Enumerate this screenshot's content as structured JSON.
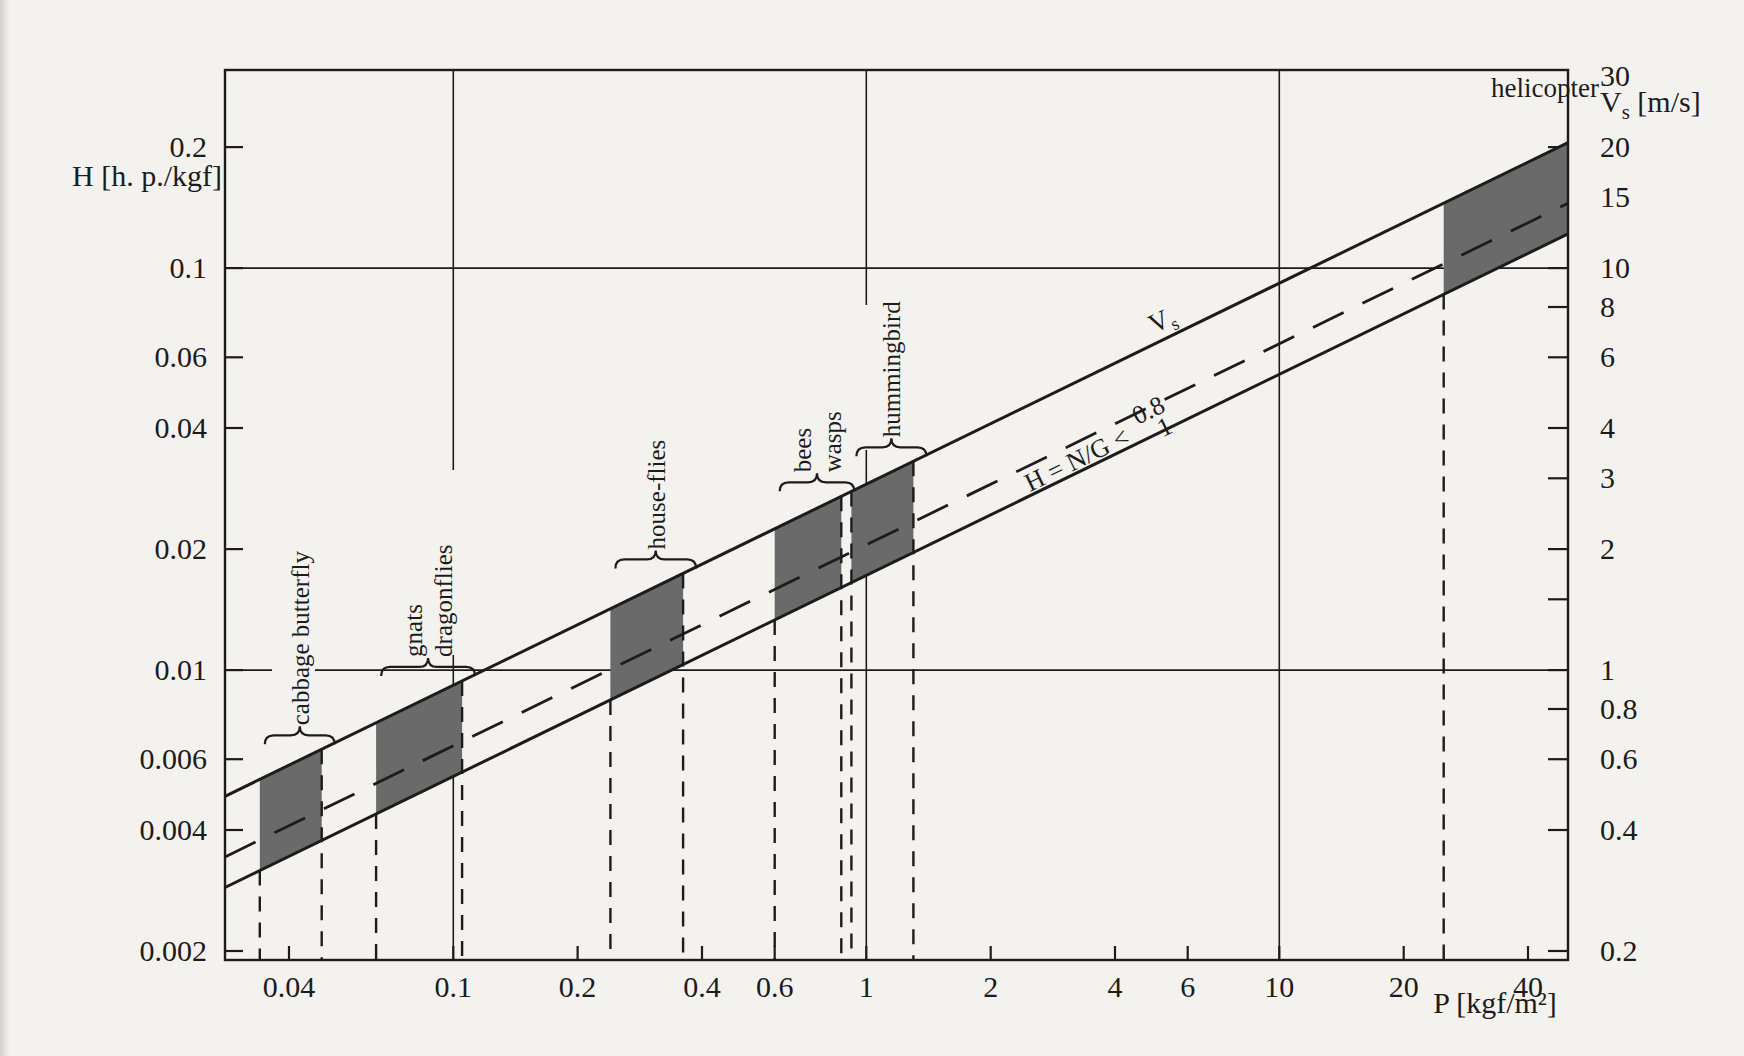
{
  "page": {
    "background": "#f4f2ee",
    "ink": "#1c1c1c"
  },
  "chart_data": {
    "type": "area",
    "x_axis": {
      "label": "P [kgf/m²]",
      "scale": "log",
      "min": 0.028,
      "max": 50,
      "ticks": [
        "0.04",
        "0.1",
        "0.2",
        "0.4",
        "0.6",
        "1",
        "2",
        "4",
        "6",
        "10",
        "20",
        "40"
      ],
      "gridlines": [
        "0.1",
        "1",
        "10"
      ]
    },
    "y_axis": {
      "label": "H [h. p./kgf]",
      "scale": "log",
      "min": 0.0019,
      "max": 0.311,
      "ticks": [
        "0.2",
        "0.1",
        "0.06",
        "0.04",
        "0.02",
        "0.01",
        "0.006",
        "0.004",
        "0.002"
      ],
      "gridlines": [
        "0.1",
        "0.01"
      ]
    },
    "y2_axis": {
      "label": "Vs [m/s]",
      "label_main": "V",
      "label_sub": "s",
      "label_unit": " [m/s]",
      "scale": "log",
      "relation": "Vs = 100 × H",
      "ticks": [
        "30",
        "20",
        "15",
        "10",
        "8",
        "6",
        "4",
        "3",
        "2",
        "1.5",
        "1",
        "0.8",
        "0.6",
        "0.4",
        "0.2"
      ],
      "unlabeled": [
        "1.5"
      ]
    },
    "band_lines": [
      {
        "id": "upper",
        "label": "0.8",
        "H_at_P1": 0.029,
        "log_slope": 0.5,
        "style": "solid"
      },
      {
        "id": "vs",
        "label": "Vs",
        "H_at_P1": 0.0205,
        "log_slope": 0.5,
        "style": "dashed"
      },
      {
        "id": "lower",
        "label": "1",
        "H_at_P1": 0.0172,
        "log_slope": 0.5,
        "style": "solid"
      }
    ],
    "annotation": {
      "text": "H = N/G <",
      "upper": "0.8",
      "lower": "1"
    },
    "vs_line_label": {
      "main": "V",
      "sub": "s"
    },
    "segments": [
      {
        "id": "cabbage-butterfly",
        "label_lines": [
          "cabbage butterfly"
        ],
        "p_min": 0.034,
        "p_max": 0.048,
        "brace": true,
        "vertical_label": true,
        "clipped_right": false
      },
      {
        "id": "gnats-dragonflies",
        "label_lines": [
          "gnats",
          "dragonflies"
        ],
        "p_min": 0.065,
        "p_max": 0.105,
        "brace": true,
        "vertical_label": true,
        "clipped_right": false
      },
      {
        "id": "house-flies",
        "label_lines": [
          "house-flies"
        ],
        "p_min": 0.24,
        "p_max": 0.36,
        "brace": true,
        "vertical_label": true,
        "clipped_right": false
      },
      {
        "id": "bees-wasps",
        "label_lines": [
          "bees",
          "wasps"
        ],
        "p_min": 0.6,
        "p_max": 0.87,
        "brace": true,
        "vertical_label": true,
        "clipped_right": false
      },
      {
        "id": "hummingbird",
        "label_lines": [
          "hummingbird"
        ],
        "p_min": 0.92,
        "p_max": 1.3,
        "brace": true,
        "vertical_label": true,
        "clipped_right": false
      },
      {
        "id": "helicopter",
        "label_lines": [
          "helicopter"
        ],
        "p_min": 25,
        "p_max": 50,
        "brace": false,
        "vertical_label": false,
        "clipped_right": true
      }
    ],
    "segment_fill": "#6a6a6a"
  }
}
